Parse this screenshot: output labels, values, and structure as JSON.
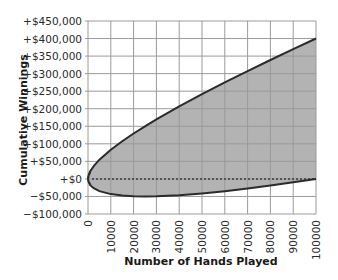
{
  "chart_data": {
    "type": "area",
    "title": "",
    "xlabel": "Number of Hands Played",
    "ylabel": "Cumulative Winnings",
    "xlim": [
      0,
      100000
    ],
    "ylim": [
      -100000,
      450000
    ],
    "grid": true,
    "legend": null,
    "x_ticks": [
      "0",
      "10000",
      "20000",
      "30000",
      "40000",
      "50000",
      "60000",
      "70000",
      "80000",
      "90000",
      "100000"
    ],
    "y_ticks": [
      "+$450,000",
      "+$400,000",
      "+$350,000",
      "+$300,000",
      "+$250,000",
      "+$200,000",
      "+$150,000",
      "+$100,000",
      "+$50,000",
      "+$0",
      "−$100,000"
    ],
    "y_tick_labels_full": [
      "+$450,000",
      "+$400,000",
      "+$350,000",
      "+$300,000",
      "+$250,000",
      "+$200,000",
      "+$150,000",
      "+$100,000",
      "+$50,000",
      "+$0",
      "−$50,000",
      "−$100,000"
    ],
    "x": [
      0,
      1000,
      2500,
      5000,
      10000,
      15000,
      20000,
      25000,
      30000,
      40000,
      50000,
      60000,
      70000,
      80000,
      90000,
      100000
    ],
    "series": [
      {
        "name": "Upper bound",
        "values": [
          0,
          22000,
          36600,
          54700,
          83200,
          107500,
          129400,
          150000,
          169500,
          206500,
          241400,
          274900,
          307300,
          338900,
          369700,
          400000
        ]
      },
      {
        "name": "Lower bound",
        "values": [
          0,
          -18000,
          -26600,
          -34700,
          -43200,
          -47500,
          -49400,
          -50000,
          -49500,
          -46500,
          -41400,
          -34900,
          -27300,
          -18900,
          -9700,
          0
        ]
      },
      {
        "name": "Break-even",
        "style": "dotted",
        "values": [
          0,
          0,
          0,
          0,
          0,
          0,
          0,
          0,
          0,
          0,
          0,
          0,
          0,
          0,
          0,
          0
        ]
      }
    ],
    "annotations": [],
    "colors": {
      "fill": "#b3b3b3",
      "curve": "#2b2b2b",
      "grid": "#9a9a9a",
      "zero_line": "#555555"
    }
  }
}
